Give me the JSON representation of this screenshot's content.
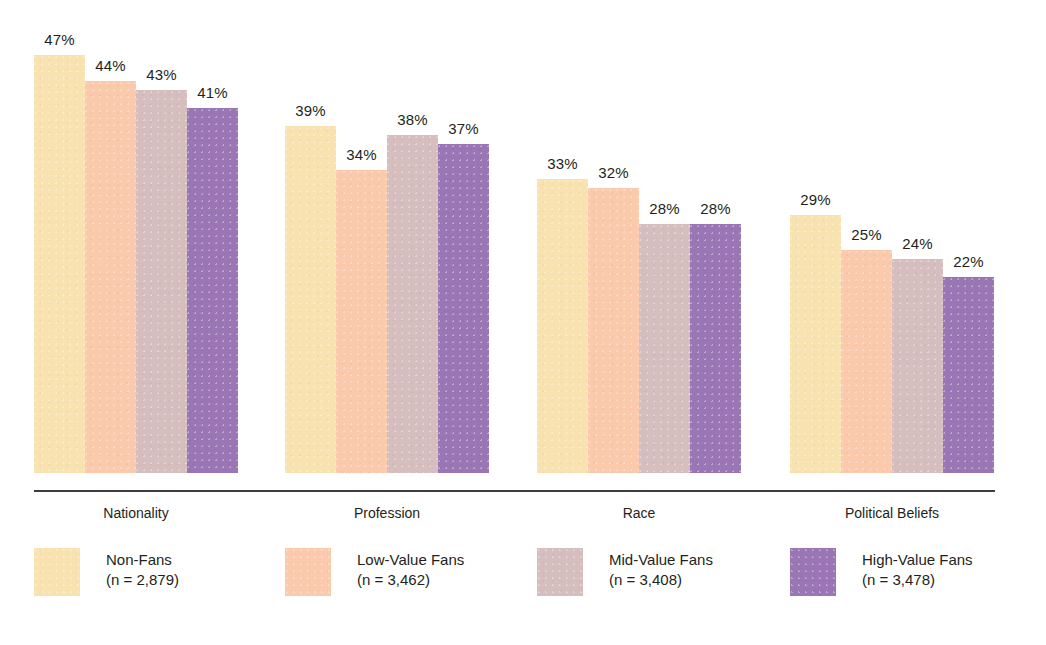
{
  "chart_data": {
    "type": "bar",
    "title": "",
    "subtitle": "",
    "xlabel": "",
    "ylabel": "",
    "ylim": [
      0,
      50
    ],
    "grid": false,
    "legend_position": "bottom",
    "value_suffix": "%",
    "categories": [
      "Nationality",
      "Profession",
      "Race",
      "Political Beliefs"
    ],
    "series": [
      {
        "name": "Non-Fans",
        "sample_label": "(n = 2,879)",
        "color": "#f7e2b0",
        "values": [
          47,
          39,
          33,
          29
        ],
        "labels": [
          "47%",
          "39%",
          "33%",
          "29%"
        ]
      },
      {
        "name": "Low-Value Fans",
        "sample_label": "(n = 3,462)",
        "color": "#fbc9ac",
        "values": [
          44,
          34,
          32,
          25
        ],
        "labels": [
          "44%",
          "34%",
          "32%",
          "25%"
        ]
      },
      {
        "name": "Mid-Value Fans",
        "sample_label": "(n = 3,408)",
        "color": "#d6bebe",
        "values": [
          43,
          38,
          28,
          24
        ],
        "labels": [
          "43%",
          "38%",
          "28%",
          "24%"
        ]
      },
      {
        "name": "High-Value Fans",
        "sample_label": "(n = 3,478)",
        "color": "#9b76b4",
        "values": [
          41,
          37,
          28,
          22
        ],
        "labels": [
          "41%",
          "37%",
          "28%",
          "22%"
        ]
      }
    ]
  },
  "axis": {
    "category_labels": [
      "Nationality",
      "Profession",
      "Race",
      "Political Beliefs"
    ]
  },
  "legend": {
    "items": [
      {
        "name": "Non-Fans",
        "sample_label": "(n = 2,879)",
        "color": "#f7e2b0"
      },
      {
        "name": "Low-Value Fans",
        "sample_label": "(n = 3,462)",
        "color": "#fbc9ac"
      },
      {
        "name": "Mid-Value Fans",
        "sample_label": "(n = 3,408)",
        "color": "#d6bebe"
      },
      {
        "name": "High-Value Fans",
        "sample_label": "(n = 3,478)",
        "color": "#9b76b4"
      }
    ]
  }
}
